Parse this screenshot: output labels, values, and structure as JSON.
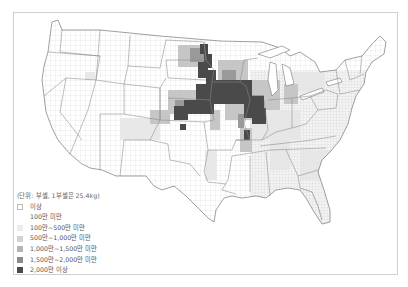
{
  "map": {
    "subject": "미국 카운티별 옥수수 생산량",
    "legend": {
      "unit": "(단위: 부셸, 1부셸은 25.4kg)",
      "items": [
        {
          "label": "이상",
          "color": "#ffffff"
        },
        {
          "label": "100만 미만",
          "color": null
        },
        {
          "label": "100만~500만 미만",
          "color": "#ececec"
        },
        {
          "label": "500만~1,000만 미만",
          "color": "#d2d2d2"
        },
        {
          "label": "1,000만~1,500만 미만",
          "color": "#b4b4b4"
        },
        {
          "label": "1,500만~2,000만 미만",
          "color": "#8a8a8a"
        },
        {
          "label": "2,000만 이상",
          "color": "#4a4a4a"
        }
      ]
    },
    "colors": {
      "frame": "#cfcfcf",
      "state_border": "#777777",
      "county_border": "#c8c8c8",
      "highest": "#4a4a4a"
    }
  }
}
